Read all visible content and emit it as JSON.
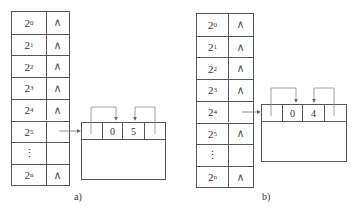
{
  "figures": [
    {
      "id": "a",
      "caption": "a)",
      "table": {
        "rows": [
          {
            "base": "2",
            "exp": "0",
            "ptr": "∧"
          },
          {
            "base": "2",
            "exp": "1",
            "ptr": "∧"
          },
          {
            "base": "2",
            "exp": "2",
            "ptr": "∧"
          },
          {
            "base": "2",
            "exp": "3",
            "ptr": "∧"
          },
          {
            "base": "2",
            "exp": "4",
            "ptr": "∧"
          },
          {
            "base": "2",
            "exp": "5",
            "ptr": ""
          },
          {
            "base": "⋮",
            "exp": "",
            "ptr": ""
          },
          {
            "base": "2",
            "exp": "n",
            "ptr": "∧"
          }
        ]
      },
      "block": {
        "cells": [
          "",
          "0",
          "5",
          ""
        ]
      }
    },
    {
      "id": "b",
      "caption": "b)",
      "table": {
        "rows": [
          {
            "base": "2",
            "exp": "0",
            "ptr": "∧"
          },
          {
            "base": "2",
            "exp": "1",
            "ptr": "∧"
          },
          {
            "base": "2",
            "exp": "2",
            "ptr": "∧"
          },
          {
            "base": "2",
            "exp": "3",
            "ptr": "∧"
          },
          {
            "base": "2",
            "exp": "4",
            "ptr": ""
          },
          {
            "base": "2",
            "exp": "5",
            "ptr": "∧"
          },
          {
            "base": "⋮",
            "exp": "",
            "ptr": ""
          },
          {
            "base": "2",
            "exp": "n",
            "ptr": "∧"
          }
        ]
      },
      "block": {
        "cells": [
          "",
          "0",
          "4",
          ""
        ]
      }
    }
  ]
}
